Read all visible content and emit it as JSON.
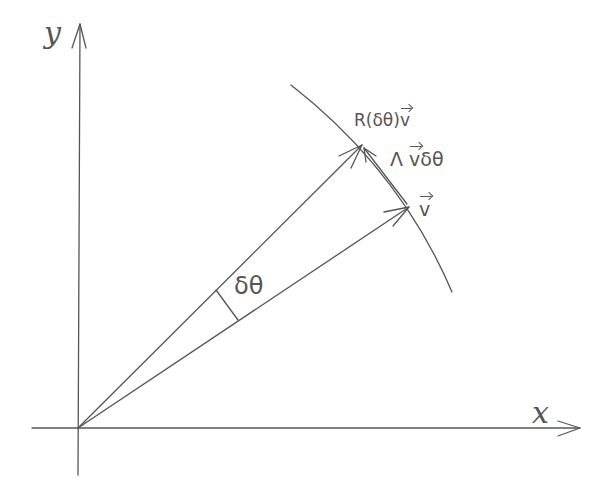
{
  "diagram": {
    "type": "vector-rotation-sketch",
    "colors": {
      "ink": "#555555",
      "background": "#ffffff"
    },
    "axes": {
      "x_label": "x",
      "y_label": "y",
      "origin_px": [
        78,
        428
      ]
    },
    "vectors": {
      "v": {
        "label": "v",
        "tip_px": [
          409,
          207
        ]
      },
      "rotated": {
        "label_prefix": "R(δθ)",
        "label_vec": "v",
        "tip_px": [
          362,
          145
        ]
      },
      "difference": {
        "label_prefix": "Λ",
        "label_vec": "v",
        "label_suffix": "δθ"
      }
    },
    "angle": {
      "label": "δθ"
    },
    "arc": {
      "start_px": [
        291,
        85
      ],
      "end_px": [
        452,
        292
      ]
    }
  }
}
